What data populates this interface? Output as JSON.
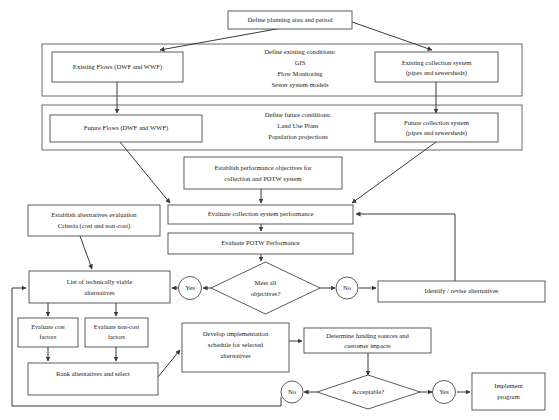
{
  "diagram": {
    "colors": {
      "box_stroke": "#4a4a4a",
      "group_stroke": "#5a5a5a",
      "connector": "#3a3a3a",
      "text": "#1a1a1a",
      "background": "#ffffff"
    },
    "nodes": {
      "define_planning": {
        "label": "Define planning area and period"
      },
      "existing_conditions_group": {
        "heading": "Define existing conditions:",
        "line1": "GIS",
        "line2": "Flow Monitoring",
        "line3": "Sewer system models"
      },
      "existing_flows": {
        "label": "Existing Flows (DWF and WWF)"
      },
      "existing_collection": {
        "line1": "Existing collection system",
        "line2": "(pipes and sewersheds)"
      },
      "future_conditions_group": {
        "heading": "Define future conditions:",
        "line1": "Land Use Plans",
        "line2": "Population projections"
      },
      "future_flows": {
        "label": "Future Flows (DWF and WWF)"
      },
      "future_collection": {
        "line1": "Future collection system",
        "line2": "(pipes and sewersheds)"
      },
      "performance_objectives": {
        "line1": "Establish performance objectives for",
        "line2": "collection and POTW system"
      },
      "evaluate_collection": {
        "label": "Evaluate collection system performance"
      },
      "evaluate_potw": {
        "label": "Evaluate POTW Performance"
      },
      "alternatives_criteria": {
        "line1": "Establish alternatives evaluation",
        "line2": "Criteria (cost and non-cost)"
      },
      "viable_alternatives": {
        "line1": "List of technically viable",
        "line2": "alternatives"
      },
      "meet_objectives": {
        "line1": "Meet all",
        "line2": "objectives?"
      },
      "yes_objectives": {
        "label": "Yes"
      },
      "no_objectives": {
        "label": "No"
      },
      "identify_revise": {
        "label": "Identify / revise alternatives"
      },
      "evaluate_cost": {
        "line1": "Evaluate cost",
        "line2": "factors"
      },
      "evaluate_noncost": {
        "line1": "Evaluate non-cost",
        "line2": "factors"
      },
      "rank_alternatives": {
        "label": "Rank alternatives and select"
      },
      "develop_schedule": {
        "line1": "Develop implementation",
        "line2": "schedule for selected",
        "line3": "alternatives"
      },
      "determine_funding": {
        "line1": "Determine funding sources and",
        "line2": "customer impacts"
      },
      "acceptable": {
        "label": "Acceptable?"
      },
      "no_acceptable": {
        "label": "No"
      },
      "yes_acceptable": {
        "label": "Yes"
      },
      "implement_program": {
        "line1": "Implement",
        "line2": "program"
      }
    }
  }
}
